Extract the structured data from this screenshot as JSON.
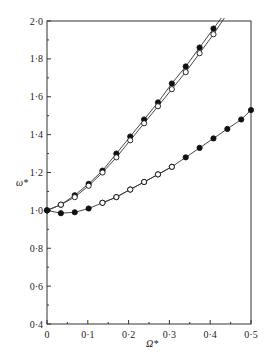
{
  "chart_data": {
    "type": "line",
    "title": "",
    "xlabel": "Ω*",
    "ylabel": "ω*",
    "xlim": [
      0,
      0.5
    ],
    "ylim": [
      0.4,
      2.0
    ],
    "xticks": [
      "0",
      "0·1",
      "0·2",
      "0·3",
      "0·4",
      "0·5"
    ],
    "xtick_values": [
      0,
      0.1,
      0.2,
      0.3,
      0.4,
      0.5
    ],
    "yticks": [
      "0·4",
      "0·6",
      "0·8",
      "1·0",
      "1·2",
      "1·4",
      "1·6",
      "1·8",
      "2·0"
    ],
    "ytick_values": [
      0.4,
      0.6,
      0.8,
      1.0,
      1.2,
      1.4,
      1.6,
      1.8,
      2.0
    ],
    "grid": false,
    "legend": null,
    "series": [
      {
        "name": "upper branch (filled)",
        "marker": "filled-circle",
        "x": [
          0,
          0.034,
          0.068,
          0.102,
          0.136,
          0.17,
          0.204,
          0.238,
          0.272,
          0.306,
          0.34,
          0.374,
          0.408,
          0.432
        ],
        "y": [
          1.0,
          1.03,
          1.08,
          1.14,
          1.21,
          1.3,
          1.39,
          1.48,
          1.57,
          1.67,
          1.76,
          1.86,
          1.96,
          2.03
        ]
      },
      {
        "name": "upper branch (open)",
        "marker": "open-circle",
        "x": [
          0,
          0.034,
          0.068,
          0.102,
          0.136,
          0.17,
          0.204,
          0.238,
          0.272,
          0.306,
          0.34,
          0.374,
          0.408,
          0.436
        ],
        "y": [
          1.0,
          1.03,
          1.07,
          1.13,
          1.2,
          1.28,
          1.37,
          1.46,
          1.55,
          1.64,
          1.73,
          1.83,
          1.93,
          2.02
        ]
      },
      {
        "name": "lower branch (filled)",
        "marker": "filled-circle",
        "x": [
          0,
          0.034,
          0.068,
          0.102,
          0.136,
          0.17,
          0.204,
          0.238,
          0.272,
          0.306,
          0.34,
          0.374,
          0.408,
          0.442,
          0.476,
          0.5
        ],
        "y": [
          1.0,
          0.985,
          0.99,
          1.01,
          1.04,
          1.07,
          1.11,
          1.15,
          1.19,
          1.23,
          1.28,
          1.33,
          1.38,
          1.43,
          1.48,
          1.53
        ]
      },
      {
        "name": "lower branch (open)",
        "marker": "open-circle",
        "x": [
          0.136,
          0.17,
          0.204,
          0.238,
          0.272,
          0.306
        ],
        "y": [
          1.04,
          1.07,
          1.11,
          1.15,
          1.19,
          1.23
        ]
      }
    ]
  },
  "frame": {
    "left": 47,
    "right": 251,
    "top": 21,
    "bottom": 324
  }
}
